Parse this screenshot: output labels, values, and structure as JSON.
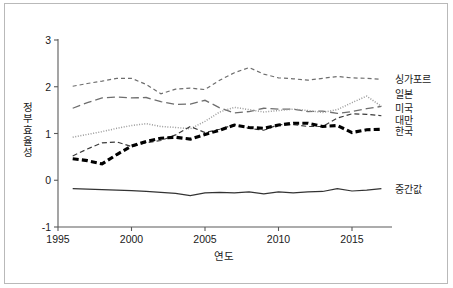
{
  "chart_data": {
    "type": "line",
    "title": "",
    "xlabel": "연도",
    "ylabel": "정부효율성",
    "xlim": [
      1995,
      2018.5
    ],
    "ylim": [
      -1.15,
      3.15
    ],
    "xticks": [
      1995,
      2000,
      2005,
      2010,
      2015
    ],
    "yticks": [
      -1,
      0,
      1,
      2,
      3
    ],
    "grid": false,
    "legend_position": "right-inline",
    "x": [
      1996,
      1997,
      1998,
      1999,
      2000,
      2001,
      2002,
      2003,
      2004,
      2005,
      2006,
      2007,
      2008,
      2009,
      2010,
      2011,
      2012,
      2013,
      2014,
      2015,
      2016,
      2017
    ],
    "series": [
      {
        "name": "싱가포르",
        "label": "싱가포르",
        "style": "dashed-short",
        "color": "#6e6e6e",
        "width": 1.2,
        "label_y": 2.17,
        "values": [
          2.01,
          2.07,
          2.12,
          2.18,
          2.18,
          2.05,
          1.85,
          1.95,
          1.97,
          1.94,
          2.14,
          2.3,
          2.41,
          2.27,
          2.19,
          2.17,
          2.14,
          2.18,
          2.22,
          2.19,
          2.18,
          2.16
        ]
      },
      {
        "name": "일본",
        "label": "일본",
        "style": "dashed-long",
        "color": "#6e6e6e",
        "width": 1.3,
        "label_y": 1.84,
        "values": [
          1.54,
          1.66,
          1.76,
          1.78,
          1.76,
          1.77,
          1.68,
          1.62,
          1.63,
          1.71,
          1.55,
          1.44,
          1.47,
          1.54,
          1.52,
          1.52,
          1.47,
          1.48,
          1.43,
          1.47,
          1.53,
          1.58
        ]
      },
      {
        "name": "미국",
        "label": "미국",
        "style": "dotted",
        "color": "#9a9a9a",
        "width": 1.5,
        "label_y": 1.55,
        "values": [
          0.92,
          0.98,
          1.04,
          1.11,
          1.17,
          1.21,
          1.15,
          1.13,
          1.1,
          1.26,
          1.46,
          1.56,
          1.51,
          1.46,
          1.49,
          1.52,
          1.49,
          1.45,
          1.51,
          1.66,
          1.8,
          1.58
        ]
      },
      {
        "name": "대만",
        "label": "대만",
        "style": "dashed-med",
        "color": "#3a3a3a",
        "width": 1.2,
        "label_y": 1.28,
        "values": [
          0.52,
          0.67,
          0.8,
          0.82,
          0.72,
          0.8,
          0.85,
          0.97,
          1.15,
          1.02,
          1.09,
          1.19,
          1.11,
          1.07,
          1.19,
          1.19,
          1.15,
          1.15,
          1.33,
          1.42,
          1.41,
          1.38
        ]
      },
      {
        "name": "한국",
        "label": "한국",
        "style": "dashed-thick",
        "color": "#000000",
        "width": 3.1,
        "label_y": 1.05,
        "values": [
          0.46,
          0.42,
          0.35,
          0.55,
          0.73,
          0.83,
          0.9,
          0.92,
          0.88,
          0.98,
          1.07,
          1.18,
          1.13,
          1.11,
          1.18,
          1.22,
          1.22,
          1.15,
          1.17,
          1.02,
          1.08,
          1.09
        ]
      },
      {
        "name": "중간값",
        "label": "중간값",
        "style": "solid",
        "color": "#333333",
        "width": 1.2,
        "label_y": -0.18,
        "values": [
          -0.18,
          -0.19,
          -0.2,
          -0.21,
          -0.22,
          -0.24,
          -0.26,
          -0.28,
          -0.33,
          -0.27,
          -0.26,
          -0.27,
          -0.25,
          -0.29,
          -0.25,
          -0.27,
          -0.25,
          -0.24,
          -0.18,
          -0.23,
          -0.21,
          -0.18
        ]
      }
    ]
  }
}
